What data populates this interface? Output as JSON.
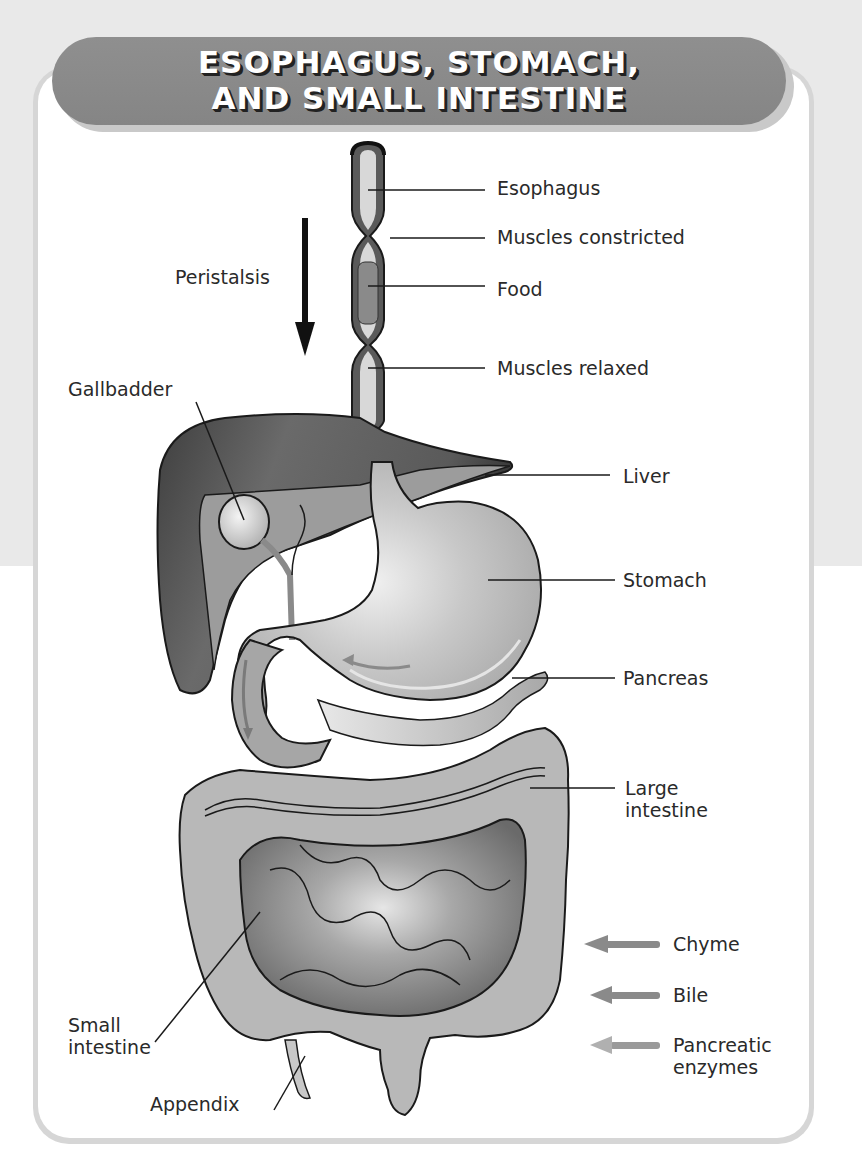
{
  "title": {
    "line1": "ESOPHAGUS, STOMACH,",
    "line2": "AND SMALL INTESTINE"
  },
  "esophagus_labels": {
    "esophagus": "Esophagus",
    "muscles_constricted": "Muscles constricted",
    "food": "Food",
    "muscles_relaxed": "Muscles relaxed",
    "peristalsis": "Peristalsis"
  },
  "organ_labels": {
    "gallbladder": "Gallbadder",
    "liver": "Liver",
    "stomach": "Stomach",
    "pancreas": "Pancreas",
    "large_intestine_1": "Large",
    "large_intestine_2": "intestine",
    "small_intestine_1": "Small",
    "small_intestine_2": "intestine",
    "appendix": "Appendix"
  },
  "legend": [
    {
      "label": "Chyme",
      "color": "#8a8a8a"
    },
    {
      "label": "Bile",
      "color": "#8a8a8a"
    },
    {
      "label": "Pancreatic",
      "label2": "enzymes",
      "color": "#9a9a9a"
    }
  ],
  "colors": {
    "banner": "#8a8a8a",
    "liver_dark": "#4a4a4a",
    "liver": "#9a9a9a",
    "stomach": "#c4c4c4",
    "large_intestine": "#b9b9b9",
    "small_intestine_dark": "#6e6e6e",
    "small_intestine": "#9c9c9c",
    "outline": "#1a1a1a"
  }
}
